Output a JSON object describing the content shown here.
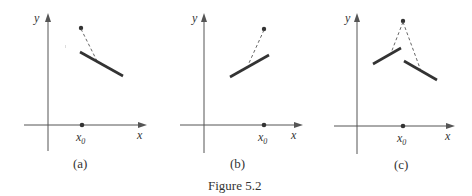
{
  "figure": {
    "caption": "Figure 5.2",
    "panels": [
      {
        "id": "a",
        "label": "(a)",
        "x_axis_label": "x",
        "y_axis_label": "y",
        "point_label": "x",
        "point_label_sub": "0",
        "description": "Function value at x0 (dot) lies above a single decreasing segment; dashed line connects dot to segment"
      },
      {
        "id": "b",
        "label": "(b)",
        "x_axis_label": "x",
        "y_axis_label": "y",
        "point_label": "x",
        "point_label_sub": "0",
        "description": "Increasing segment approaching x0 from the left; isolated dot above; dashed line connects them"
      },
      {
        "id": "c",
        "label": "(c)",
        "x_axis_label": "x",
        "y_axis_label": "y",
        "point_label": "x",
        "point_label_sub": "0",
        "description": "Increasing segment on left and decreasing segment on right of x0 with a jump; isolated dot above; dashed lines connect dot to both segments"
      }
    ]
  },
  "colors": {
    "ink": "#333333",
    "axis": "#555555",
    "background": "#ffffff"
  }
}
